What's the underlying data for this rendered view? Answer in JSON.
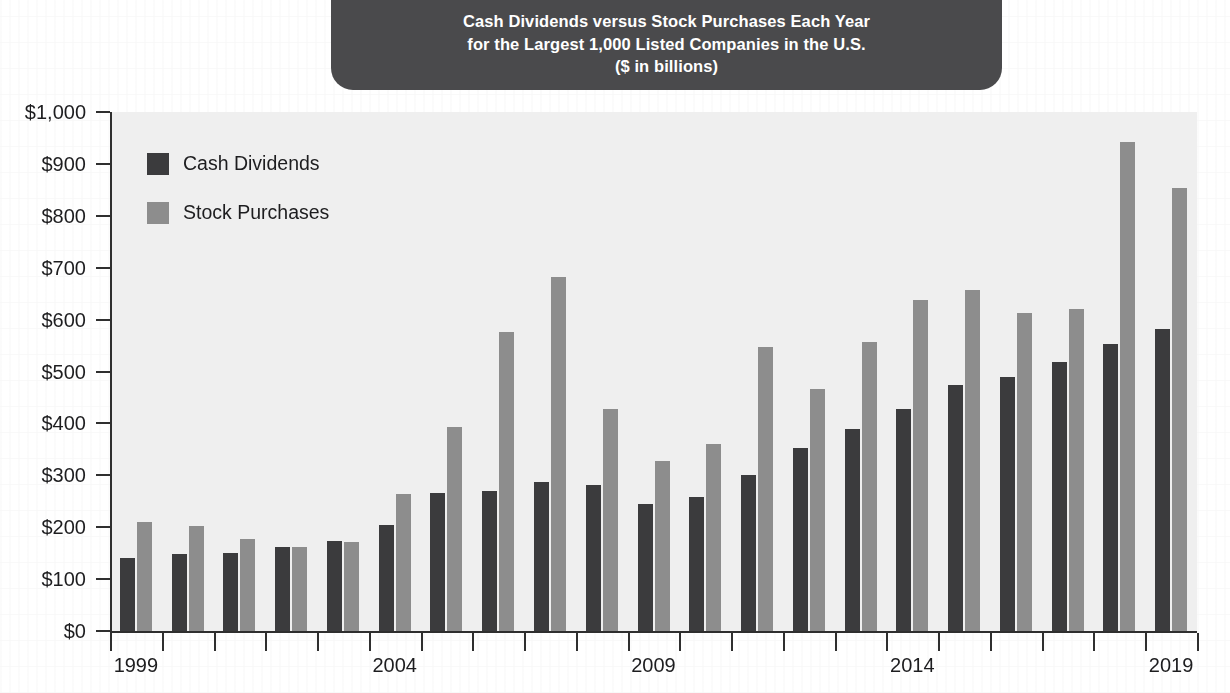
{
  "title": {
    "line1": "Cash Dividends versus Stock Purchases Each Year",
    "line2": "for the Largest 1,000 Listed Companies in the U.S.",
    "line3": "($ in billions)"
  },
  "legend": {
    "items": [
      {
        "label": "Cash Dividends",
        "color": "#3b3b3d"
      },
      {
        "label": "Stock Purchases",
        "color": "#8d8d8d"
      }
    ]
  },
  "axis": {
    "y_ticks": [
      "$1,000",
      "$900",
      "$800",
      "$700",
      "$600",
      "$500",
      "$400",
      "$300",
      "$200",
      "$100",
      "$0"
    ],
    "x_labels": [
      "1999",
      "2004",
      "2009",
      "2014",
      "2019"
    ]
  },
  "colors": {
    "plot_background": "#efefef",
    "axis": "#2f2f2f",
    "title_pill": "#4a4a4c",
    "title_text": "#ffffff",
    "text": "#1d1d1f"
  },
  "chart_data": {
    "type": "bar",
    "title": "Cash Dividends versus Stock Purchases Each Year for the Largest 1,000 Listed Companies in the U.S. ($ in billions)",
    "xlabel": "",
    "ylabel": "$ in billions",
    "ylim": [
      0,
      1000
    ],
    "ytick_values": [
      0,
      100,
      200,
      300,
      400,
      500,
      600,
      700,
      800,
      900,
      1000
    ],
    "grid": false,
    "legend_position": "inside-top-left",
    "categories": [
      "1999",
      "2000",
      "2001",
      "2002",
      "2003",
      "2004",
      "2005",
      "2006",
      "2007",
      "2008",
      "2009",
      "2010",
      "2011",
      "2012",
      "2013",
      "2014",
      "2015",
      "2016",
      "2017",
      "2018",
      "2019"
    ],
    "labeled_categories": [
      "1999",
      "2004",
      "2009",
      "2014",
      "2019"
    ],
    "series": [
      {
        "name": "Cash Dividends",
        "color": "#3b3b3d",
        "values": [
          141,
          148,
          151,
          162,
          173,
          204,
          266,
          270,
          288,
          282,
          245,
          259,
          301,
          353,
          389,
          428,
          474,
          490,
          518,
          553,
          582
        ]
      },
      {
        "name": "Stock Purchases",
        "color": "#8d8d8d",
        "values": [
          211,
          202,
          177,
          162,
          172,
          264,
          393,
          577,
          682,
          427,
          328,
          360,
          548,
          466,
          556,
          637,
          658,
          612,
          620,
          943,
          853
        ]
      }
    ]
  }
}
